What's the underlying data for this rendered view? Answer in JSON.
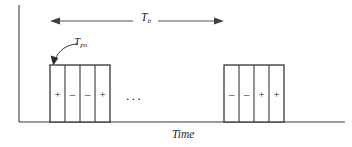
{
  "figure": {
    "caption_axis_x": "Time",
    "span_label": {
      "base": "T",
      "sub": "b"
    },
    "chip_label": {
      "base": "T",
      "sub": "pn"
    },
    "ellipsis": "...",
    "axis": {
      "y_axis_x": 19,
      "y_axis_top": 5,
      "baseline_y": 122,
      "x_axis_start": 19,
      "x_axis_end": 345,
      "color": "#3a3a3a"
    },
    "span_arrow": {
      "x_start": 50,
      "x_end": 224,
      "y": 21,
      "color": "#3f3f3f"
    },
    "chip_arrow": {
      "from_x": 78,
      "from_y": 45,
      "to_x": 53,
      "to_y": 64,
      "color": "#2b2b2b"
    },
    "pulse_top_y": 65,
    "pulse_bottom_y": 122,
    "stroke_color": "#2e2e2e",
    "fill_color": "#ffffff",
    "groups": [
      {
        "name": "first-pulse-group",
        "x_start": 50,
        "x_end": 110,
        "chips": [
          {
            "sign": "+",
            "x_start": 50,
            "x_end": 65
          },
          {
            "sign": "–",
            "x_start": 65,
            "x_end": 80
          },
          {
            "sign": "–",
            "x_start": 80,
            "x_end": 95
          },
          {
            "sign": "+",
            "x_start": 95,
            "x_end": 110
          }
        ]
      },
      {
        "name": "second-pulse-group",
        "x_start": 224,
        "x_end": 284,
        "chips": [
          {
            "sign": "–",
            "x_start": 224,
            "x_end": 239
          },
          {
            "sign": "–",
            "x_start": 239,
            "x_end": 254
          },
          {
            "sign": "+",
            "x_start": 254,
            "x_end": 269
          },
          {
            "sign": "+",
            "x_start": 269,
            "x_end": 284
          }
        ]
      }
    ]
  }
}
